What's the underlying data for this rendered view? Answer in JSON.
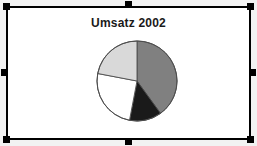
{
  "object": {
    "kind": "selected-chart-object",
    "selected": true,
    "handle_count": 8,
    "handle_color": "#000000",
    "frame_border_color": "#000000",
    "frame_background": "#ffffff",
    "page_background": "#f2f2f2"
  },
  "chart_data": {
    "type": "pie",
    "title": "Umsatz 2002",
    "subtitle": "",
    "xlabel": "",
    "ylabel": "",
    "grid": false,
    "legend": "none",
    "start_angle_deg": 0,
    "direction": "clockwise",
    "categories": [
      "Segment 1",
      "Segment 2",
      "Segment 3",
      "Segment 4"
    ],
    "values": [
      40,
      13,
      25,
      22
    ],
    "slices": [
      {
        "label": "Segment 1",
        "value": 40,
        "percent": 40,
        "color": "#808080",
        "angle_start_deg": 0,
        "angle_end_deg": 144
      },
      {
        "label": "Segment 2",
        "value": 13,
        "percent": 13,
        "color": "#1a1a1a",
        "angle_start_deg": 144,
        "angle_end_deg": 191
      },
      {
        "label": "Segment 3",
        "value": 25,
        "percent": 25,
        "color": "#ffffff",
        "angle_start_deg": 191,
        "angle_end_deg": 281
      },
      {
        "label": "Segment 4",
        "value": 22,
        "percent": 22,
        "color": "#d9d9d9",
        "angle_start_deg": 281,
        "angle_end_deg": 360
      }
    ],
    "outline_color": "#4d4d4d"
  }
}
